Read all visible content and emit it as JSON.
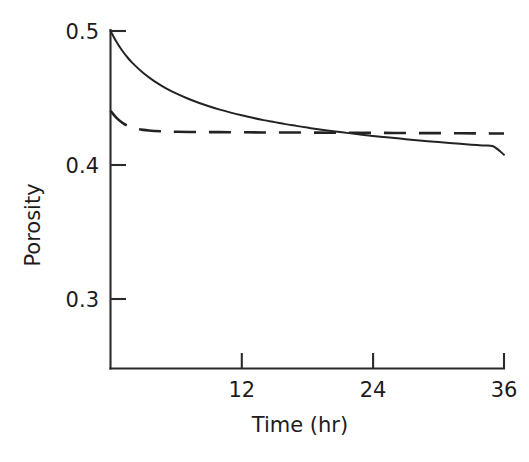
{
  "chart_data": {
    "type": "line",
    "title": "",
    "subtitle": "",
    "xlabel": "Time (hr)",
    "ylabel": "Porosity",
    "xlim": [
      0,
      36
    ],
    "ylim": [
      0.26,
      0.5
    ],
    "xticks": [
      12,
      24,
      36
    ],
    "xtick_labels": [
      "12",
      "24",
      "36"
    ],
    "yticks": [
      0.3,
      0.4,
      0.5
    ],
    "ytick_labels": [
      "0.3",
      "0.4",
      "0.5"
    ],
    "grid": false,
    "legend": "none",
    "line_color": "#232323",
    "background_color": "#ffffff",
    "annotations": [],
    "series": [
      {
        "name": "solid-curve",
        "style": "solid",
        "x": [
          0,
          0.5,
          1,
          1.5,
          2,
          3,
          4,
          5,
          6,
          7,
          8,
          9,
          10,
          11,
          12,
          13,
          14,
          15,
          16,
          17,
          18,
          19,
          20,
          21,
          22,
          23,
          24,
          25,
          26,
          27,
          28,
          29,
          30,
          31,
          32,
          33,
          34,
          35,
          36
        ],
        "y": [
          0.5,
          0.4925,
          0.4862,
          0.4808,
          0.4762,
          0.4686,
          0.4626,
          0.4576,
          0.4534,
          0.4498,
          0.4466,
          0.4438,
          0.4413,
          0.4391,
          0.4371,
          0.4352,
          0.4335,
          0.432,
          0.4305,
          0.4292,
          0.4279,
          0.4267,
          0.4256,
          0.4246,
          0.4236,
          0.4226,
          0.4217,
          0.4209,
          0.4201,
          0.4193,
          0.4185,
          0.4178,
          0.4171,
          0.4165,
          0.4158,
          0.4152,
          0.4146,
          0.414,
          0.4077
        ]
      },
      {
        "name": "dashed-curve",
        "style": "dashed",
        "x": [
          0,
          0.4,
          0.8,
          1.2,
          1.6,
          2,
          2.5,
          3,
          3.5,
          4,
          5,
          6,
          8,
          10,
          12,
          14,
          16,
          18,
          20,
          22,
          24,
          26,
          28,
          30,
          32,
          34,
          36
        ],
        "y": [
          0.4405,
          0.4365,
          0.4333,
          0.4309,
          0.4292,
          0.428,
          0.4269,
          0.4262,
          0.4257,
          0.4254,
          0.425,
          0.4248,
          0.4246,
          0.4245,
          0.4244,
          0.4243,
          0.4243,
          0.4242,
          0.4241,
          0.4241,
          0.424,
          0.4239,
          0.4238,
          0.4238,
          0.4237,
          0.4236,
          0.4235
        ]
      }
    ]
  },
  "axes": {
    "ylabel": "Porosity",
    "xlabel": "Time (hr)",
    "ytick_labels": [
      "0.5",
      "0.4",
      "0.3"
    ],
    "xtick_labels": [
      "12",
      "24",
      "36"
    ]
  }
}
